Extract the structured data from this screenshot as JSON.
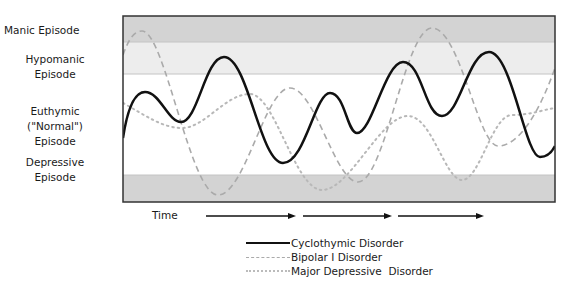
{
  "diagram": {
    "y_labels": {
      "manic": "Manic Episode",
      "hypomanic": "Hypomanic Episode",
      "hypomanic_line1": "Hypomanic",
      "hypomanic_line2": "Episode",
      "euthymic_line1": "Euthymic",
      "euthymic_line2": "(\"Normal\")",
      "euthymic_line3": "Episode",
      "depressive_line1": "Depressive",
      "depressive_line2": "Episode"
    },
    "x_label": "Time",
    "time_arrows": 3,
    "bands": [
      {
        "name": "Manic Episode",
        "color": "#d3d3d3"
      },
      {
        "name": "Hypomanic Episode",
        "color": "#ededed"
      },
      {
        "name": "Euthymic (\"Normal\") Episode",
        "color": "#ffffff"
      },
      {
        "name": "Depressive Episode",
        "color": "#d3d3d3"
      }
    ],
    "legend": [
      {
        "label": "Cyclothymic Disorder",
        "style": "solid",
        "color": "#111111"
      },
      {
        "label": "Bipolar I Disorder",
        "style": "dashed",
        "color": "#aaaaaa"
      },
      {
        "label": "Major Depressive  Disorder",
        "style": "dotted",
        "color": "#bbbbbb"
      }
    ]
  }
}
